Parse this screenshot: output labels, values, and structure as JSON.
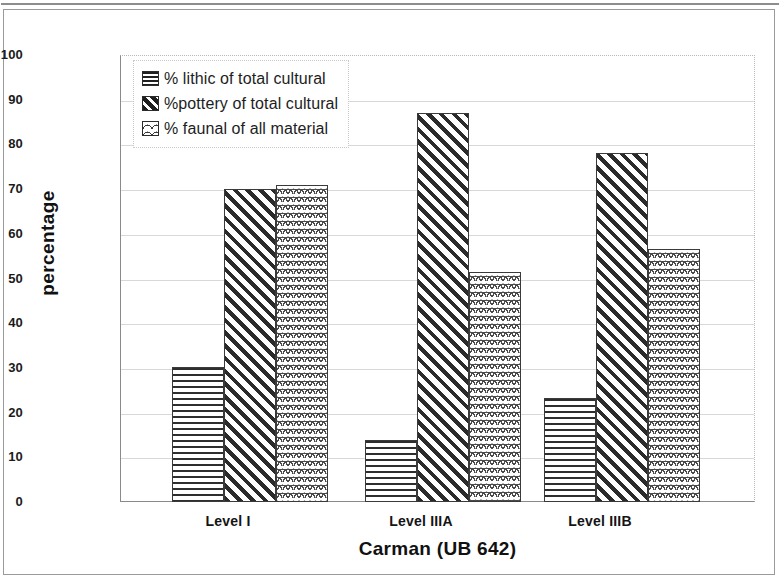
{
  "chart_data": {
    "type": "bar",
    "title": "",
    "xlabel": "Carman (UB 642)",
    "ylabel": "percentage",
    "categories": [
      "Level I",
      "Level IIIA",
      "Level IIIB"
    ],
    "series": [
      {
        "name": "% lithic of total cultural",
        "pattern": "horizontal-lines",
        "values": [
          30.3,
          13.9,
          23.3
        ]
      },
      {
        "name": "%pottery of total cultural",
        "pattern": "diagonal-hatch",
        "values": [
          70.0,
          87.1,
          78.0
        ]
      },
      {
        "name": "% faunal of all material",
        "pattern": "scale-weave",
        "values": [
          71.0,
          51.5,
          56.6
        ]
      }
    ],
    "ylim": [
      0,
      100
    ],
    "ytick_labels": [
      "100",
      "90",
      "80",
      "70",
      "60",
      "50",
      "40",
      "30",
      "20",
      "10",
      "0"
    ],
    "ytick_values": [
      100,
      90,
      80,
      70,
      60,
      50,
      40,
      30,
      20,
      10,
      0
    ],
    "grid": true,
    "legend_position": "top-left-inside"
  },
  "legend": {
    "items": [
      {
        "label": "% lithic of total cultural"
      },
      {
        "label": "%pottery of total cultural"
      },
      {
        "label": "% faunal of all material"
      }
    ]
  },
  "axes": {
    "y_title": "percentage",
    "x_title": "Carman (UB 642)",
    "x_labels": [
      "Level I",
      "Level IIIA",
      "Level IIIB"
    ],
    "y_labels": [
      "100",
      "90",
      "80",
      "70",
      "60",
      "50",
      "40",
      "30",
      "20",
      "10",
      "0"
    ]
  }
}
